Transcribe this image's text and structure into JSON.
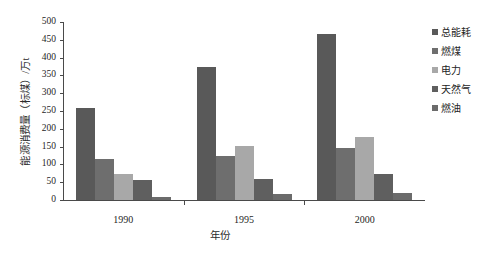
{
  "chart_data": {
    "type": "bar",
    "title": "",
    "xlabel": "年份",
    "ylabel": "能源消费量（标煤）/万t",
    "categories": [
      "1990",
      "1995",
      "2000"
    ],
    "ylim": [
      0,
      500
    ],
    "yticks": [
      0,
      50,
      100,
      150,
      200,
      250,
      300,
      350,
      400,
      450,
      500
    ],
    "grid": false,
    "legend_position": "right",
    "series": [
      {
        "name": "总能耗",
        "color": "#595959",
        "values": [
          258,
          373,
          466
        ]
      },
      {
        "name": "燃煤",
        "color": "#6e6e6e",
        "values": [
          114,
          124,
          147
        ]
      },
      {
        "name": "电力",
        "color": "#a8a8a8",
        "values": [
          72,
          151,
          178
        ]
      },
      {
        "name": "天然气",
        "color": "#5f5f5f",
        "values": [
          55,
          60,
          73
        ]
      },
      {
        "name": "燃油",
        "color": "#6b6b6b",
        "values": [
          8,
          16,
          19
        ]
      }
    ]
  }
}
